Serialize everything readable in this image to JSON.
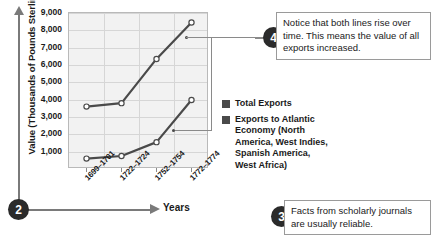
{
  "chart_data": {
    "type": "line",
    "title": "",
    "xlabel": "Years",
    "ylabel": "Value (Thousands of Pounds Sterling)",
    "categories": [
      "1699–1701",
      "1722–1724",
      "1752–1754",
      "1772–1774"
    ],
    "ylim": [
      0,
      9000
    ],
    "yticks": [
      "1,000",
      "2,000",
      "3,000",
      "4,000",
      "5,000",
      "6,000",
      "7,000",
      "8,000",
      "9,000"
    ],
    "ytick_values": [
      1000,
      2000,
      3000,
      4000,
      5000,
      6000,
      7000,
      8000,
      9000
    ],
    "grid": true,
    "legend_position": "right",
    "series": [
      {
        "name": "Total Exports",
        "color": "#4a4a4a",
        "values": [
          3600,
          3800,
          6350,
          8450
        ]
      },
      {
        "name": "Exports to Atlantic Economy (North America, West Indies, Spanish America, West Africa)",
        "color": "#4a4a4a",
        "values": [
          600,
          750,
          1550,
          3980
        ]
      }
    ]
  },
  "legend": {
    "items": [
      {
        "label": "Total Exports"
      },
      {
        "label": "Exports to Atlantic Economy (North America, West Indies, Spanish America, West Africa)"
      }
    ]
  },
  "callouts": [
    {
      "number": "2",
      "text": ""
    },
    {
      "number": "3",
      "text": "Facts from scholarly journals are usually reliable."
    },
    {
      "number": "4",
      "text": "Notice that both lines rise over time. This means the value of all exports increased."
    }
  ],
  "colors": {
    "line": "#4a4a4a",
    "plot_background": "#f2f2f2",
    "gridline": "#d6d6d6",
    "badge": "#2b2b2b",
    "connector": "#8a8a8a"
  }
}
